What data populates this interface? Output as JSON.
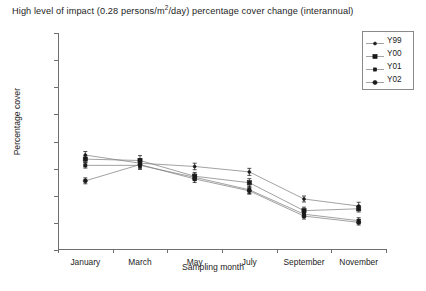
{
  "chart_data": {
    "type": "line",
    "title": "High level of impact (0.28 persons/m2/day) percentage cover change (interannual)",
    "title_parts": {
      "before": "High level of impact (0.28 persons/m",
      "sup": "2",
      "after": "/day) percentage cover change (interannual)"
    },
    "xlabel": "Sampling month",
    "ylabel": "Percentage cover",
    "categories": [
      "January",
      "March",
      "May",
      "July",
      "September",
      "November"
    ],
    "ylim": [
      20,
      100
    ],
    "yticks": [
      20,
      30,
      40,
      50,
      60,
      70,
      80,
      90,
      100
    ],
    "grid": false,
    "legend_position": "top-right",
    "series": [
      {
        "name": "Y99",
        "marker": "dot",
        "values": [
          55.0,
          52.0,
          50.8,
          48.8,
          38.8,
          36.2
        ],
        "errors": [
          1.3,
          1.6,
          1.2,
          1.3,
          1.1,
          1.4
        ]
      },
      {
        "name": "Y00",
        "marker": "filled-square",
        "values": [
          53.5,
          53.0,
          47.2,
          44.8,
          34.5,
          35.2
        ],
        "errors": [
          1.2,
          1.8,
          1.4,
          1.5,
          1.3,
          1.2
        ]
      },
      {
        "name": "Y01",
        "marker": "small-square",
        "values": [
          51.2,
          51.2,
          46.8,
          42.2,
          33.2,
          30.8
        ],
        "errors": [
          1.0,
          1.5,
          1.2,
          1.4,
          1.2,
          1.1
        ]
      },
      {
        "name": "Y02",
        "marker": "filled-circle",
        "values": [
          45.5,
          51.5,
          46.2,
          41.8,
          32.5,
          30.2
        ],
        "errors": [
          1.1,
          1.4,
          1.3,
          1.2,
          1.1,
          1.0
        ]
      }
    ]
  },
  "colors": {
    "line": "#7a7a7a",
    "marker": "#1a1a1a",
    "axis": "#6f6f6f",
    "text": "#1d1d1d",
    "background": "#ffffff"
  }
}
